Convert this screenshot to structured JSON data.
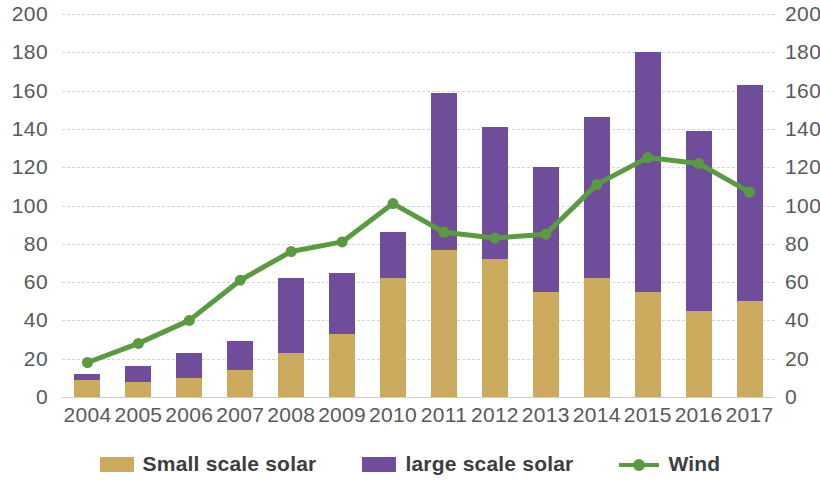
{
  "chart_data": {
    "type": "bar",
    "title": "",
    "xlabel": "",
    "ylabel": "",
    "ylim": [
      0,
      200
    ],
    "yticks": [
      0,
      20,
      40,
      60,
      80,
      100,
      120,
      140,
      160,
      180,
      200
    ],
    "y2lim": [
      0,
      200
    ],
    "y2ticks": [
      0,
      20,
      40,
      60,
      80,
      100,
      120,
      140,
      160,
      180,
      200
    ],
    "grid": true,
    "legend_position": "bottom",
    "stacked": true,
    "categories": [
      "2004",
      "2005",
      "2006",
      "2007",
      "2008",
      "2009",
      "2010",
      "2011",
      "2012",
      "2013",
      "2014",
      "2015",
      "2016",
      "2017"
    ],
    "series": [
      {
        "name": "Small scale solar",
        "type": "bar",
        "color": "#cdab5e",
        "values": [
          9,
          8,
          10,
          14,
          23,
          33,
          62,
          77,
          72,
          55,
          62,
          55,
          45,
          50
        ]
      },
      {
        "name": "large scale solar",
        "type": "bar",
        "color": "#6f4d9a",
        "values": [
          3,
          8,
          13,
          15,
          39,
          32,
          24,
          82,
          69,
          65,
          84,
          125,
          94,
          113
        ]
      },
      {
        "name": "Wind",
        "type": "line",
        "color": "#5a9b3f",
        "values": [
          18,
          28,
          40,
          61,
          76,
          81,
          101,
          86,
          83,
          85,
          111,
          125,
          122,
          107
        ]
      }
    ],
    "stack_totals": [
      12,
      16,
      23,
      29,
      62,
      65,
      86,
      159,
      141,
      120,
      146,
      180,
      139,
      163
    ]
  },
  "legend": {
    "items": [
      {
        "label": "Small scale solar",
        "swatch": "small-scale-solar-swatch"
      },
      {
        "label": "large scale solar",
        "swatch": "large-scale-solar-swatch"
      },
      {
        "label": "Wind",
        "swatch": "wind-line-swatch"
      }
    ]
  }
}
